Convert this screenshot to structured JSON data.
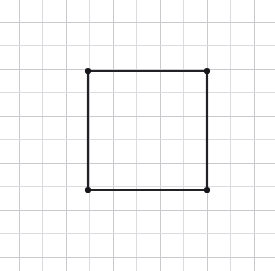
{
  "page": {
    "width": 275,
    "height": 271,
    "background_color": "#ffffff"
  },
  "clipped_header": {
    "visible_text": "▔ ▔▔ ▔ ▔▔▔ ▔▔ ▔ ▔▔▔▔ ▔▔ ▔▔▔ ▔ ▔▔",
    "note": "bottom sliver of a cut-off line of text, illegible"
  },
  "grid": {
    "label": "graph paper grid",
    "line_color": "#dcdce0",
    "line_color_strong": "#c9c9ce",
    "line_width": 1,
    "spacing": 23.5,
    "origin_x": 19,
    "origin_y": 22,
    "columns": 11,
    "rows": 11,
    "x_positions": [
      19,
      42.5,
      66,
      89.5,
      113,
      136.5,
      160,
      183.5,
      207,
      230.5,
      254
    ],
    "y_positions": [
      22,
      45.5,
      69,
      92.5,
      116,
      139.5,
      163,
      186.5,
      210,
      233.5,
      257
    ]
  },
  "chart_data": {
    "type": "scatter",
    "title": "",
    "xlabel": "",
    "ylabel": "",
    "grid": true,
    "legend": null,
    "shape": "square",
    "vertex_count": 4,
    "side_length_px": 119,
    "side_length_cells": 5,
    "vertices": [
      {
        "name": "top-left",
        "x": 88,
        "y": 71
      },
      {
        "name": "top-right",
        "x": 207,
        "y": 71
      },
      {
        "name": "bottom-right",
        "x": 207,
        "y": 190
      },
      {
        "name": "bottom-left",
        "x": 88,
        "y": 190
      }
    ],
    "edges": [
      {
        "name": "top-edge",
        "from": "top-left",
        "to": "top-right"
      },
      {
        "name": "right-edge",
        "from": "top-right",
        "to": "bottom-right"
      },
      {
        "name": "bottom-edge",
        "from": "bottom-right",
        "to": "bottom-left"
      },
      {
        "name": "left-edge",
        "from": "bottom-left",
        "to": "top-left"
      }
    ],
    "style": {
      "stroke_color": "#222226",
      "stroke_width": 2.2,
      "vertex_marker_color": "#17171b",
      "vertex_marker_radius": 3.1,
      "fill": "none"
    }
  }
}
